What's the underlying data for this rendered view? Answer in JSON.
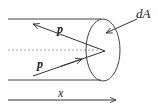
{
  "diagram": {
    "labels": {
      "area_element": "dA",
      "momentum_incoming": "p",
      "momentum_outgoing": "p",
      "axis": "x"
    },
    "colors": {
      "stroke": "#333333",
      "dashed": "#888888",
      "background": "#ffffff"
    }
  }
}
